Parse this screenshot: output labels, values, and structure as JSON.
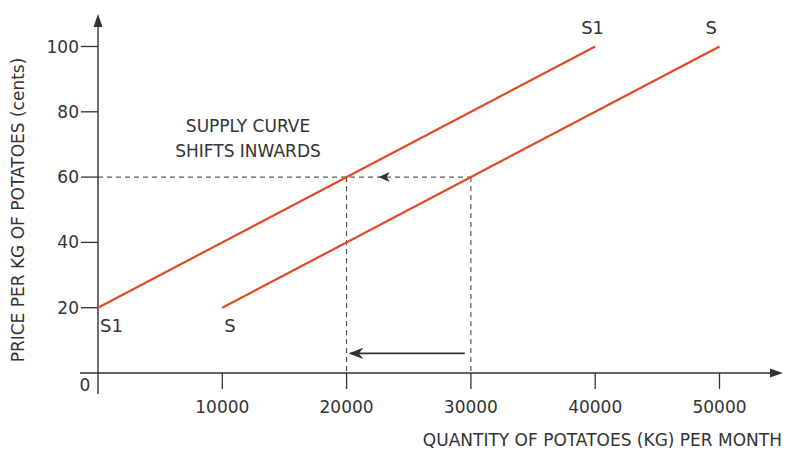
{
  "chart_data": {
    "type": "line",
    "title": "",
    "xlabel": "QUANTITY OF POTATOES (KG) PER MONTH",
    "ylabel": "PRICE PER KG OF POTATOES (cents)",
    "xlim": [
      0,
      55000
    ],
    "ylim": [
      0,
      105
    ],
    "origin_label": "0",
    "x_ticks": [
      10000,
      20000,
      30000,
      40000,
      50000
    ],
    "x_tick_labels": [
      "10000",
      "20000",
      "30000",
      "40000",
      "50000"
    ],
    "y_ticks": [
      20,
      40,
      60,
      80,
      100
    ],
    "y_tick_labels": [
      "20",
      "40",
      "60",
      "80",
      "100"
    ],
    "grid": false,
    "legend": null,
    "series": [
      {
        "name": "S1",
        "start_label": "S1",
        "end_label": "S1",
        "color": "#e04a24",
        "x": [
          0,
          40000
        ],
        "y": [
          20,
          100
        ]
      },
      {
        "name": "S",
        "start_label": "S",
        "end_label": "S",
        "color": "#e04a24",
        "x": [
          10000,
          50000
        ],
        "y": [
          20,
          100
        ]
      }
    ],
    "guides": {
      "price_level": 60,
      "quantities": [
        20000,
        30000
      ],
      "style": "dashed",
      "color": "#333333"
    },
    "annotations": [
      {
        "type": "text",
        "lines": [
          "SUPPLY CURVE",
          "SHIFTS INWARDS"
        ]
      },
      {
        "type": "arrow",
        "style": "dashed-line-arrow",
        "at_price": 60,
        "direction": "left",
        "x": 22500
      },
      {
        "type": "arrow",
        "style": "solid",
        "from_x": 29500,
        "to_x": 20300,
        "y": 6
      }
    ]
  },
  "colors": {
    "curve": "#e04a24",
    "axis": "#333333",
    "text": "#333333",
    "background": "#ffffff"
  }
}
